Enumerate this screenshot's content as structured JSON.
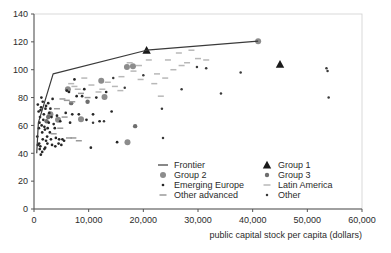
{
  "chart_data": {
    "type": "scatter",
    "title": "",
    "xlabel": "public capital stock per capita (dollars)",
    "ylabel": "",
    "xlim": [
      0,
      60000
    ],
    "ylim": [
      0,
      140
    ],
    "xticks": [
      0,
      10000,
      20000,
      30000,
      40000,
      50000,
      60000
    ],
    "xticklabels": [
      "0",
      "10,000",
      "20,000",
      "30,000",
      "40,000",
      "50,000",
      "60,000"
    ],
    "yticks": [
      0,
      20,
      40,
      60,
      80,
      100,
      120,
      140
    ],
    "yticklabels": [
      "0",
      "20",
      "40",
      "60",
      "80",
      "100",
      "120",
      "140"
    ],
    "grid": false,
    "legend_position": "inside-lower-right",
    "legend": [
      {
        "label": "Frontier",
        "marker": "line",
        "color": "#3a3a3a"
      },
      {
        "label": "Group 1",
        "marker": "triangle",
        "color": "#1a1a1a"
      },
      {
        "label": "Group 2",
        "marker": "circle-large",
        "color": "#8c8c8c"
      },
      {
        "label": "Group 3",
        "marker": "circle-small",
        "color": "#6e6e6e"
      },
      {
        "label": "Emerging Europe",
        "marker": "dot",
        "color": "#262626"
      },
      {
        "label": "Latin America",
        "marker": "dash",
        "color": "#b8b8b8"
      },
      {
        "label": "Other advanced",
        "marker": "dash",
        "color": "#9a9a9a"
      },
      {
        "label": "Other",
        "marker": "dot-small",
        "color": "#3a3a3a"
      }
    ],
    "series": [
      {
        "name": "Frontier",
        "type": "line",
        "color": "#3a3a3a",
        "points": [
          [
            500,
            40
          ],
          [
            800,
            62
          ],
          [
            3500,
            97
          ],
          [
            20600,
            114
          ],
          [
            41000,
            120.5
          ]
        ]
      },
      {
        "name": "Group 1",
        "type": "triangle",
        "color": "#1a1a1a",
        "points": [
          [
            45000,
            104
          ],
          [
            20600,
            114
          ]
        ]
      },
      {
        "name": "Group 2",
        "type": "circle-large",
        "color": "#8c8c8c",
        "points": [
          [
            41000,
            120.5
          ],
          [
            17000,
            102
          ],
          [
            18100,
            102.5
          ],
          [
            12300,
            92
          ],
          [
            12900,
            80.5
          ],
          [
            6200,
            86
          ],
          [
            4400,
            64
          ],
          [
            17100,
            48
          ],
          [
            8600,
            64.5
          ],
          [
            3000,
            68
          ]
        ]
      },
      {
        "name": "Group 3",
        "type": "circle-small",
        "color": "#6e6e6e",
        "points": [
          [
            18500,
            59.5
          ],
          [
            9800,
            77
          ],
          [
            6800,
            76
          ],
          [
            2600,
            66
          ],
          [
            2300,
            63
          ]
        ]
      },
      {
        "name": "Emerging Europe",
        "type": "dot",
        "color": "#262626",
        "points": [
          [
            700,
            46
          ],
          [
            600,
            52
          ],
          [
            900,
            58
          ],
          [
            1000,
            62
          ],
          [
            1100,
            66
          ],
          [
            1200,
            71
          ],
          [
            1300,
            73
          ],
          [
            1400,
            60
          ],
          [
            1500,
            55
          ],
          [
            1600,
            50
          ],
          [
            1700,
            64
          ],
          [
            1800,
            68
          ],
          [
            1900,
            59
          ],
          [
            2000,
            57
          ],
          [
            2100,
            72
          ],
          [
            2200,
            49
          ],
          [
            2400,
            52
          ],
          [
            2500,
            58
          ],
          [
            2700,
            62
          ],
          [
            2800,
            69
          ],
          [
            2900,
            55
          ],
          [
            3100,
            50
          ],
          [
            3200,
            66
          ],
          [
            3400,
            79
          ],
          [
            3600,
            61
          ],
          [
            3800,
            58
          ],
          [
            4000,
            51
          ],
          [
            4200,
            67
          ],
          [
            4600,
            50
          ],
          [
            4800,
            63
          ],
          [
            5200,
            50
          ],
          [
            5500,
            49
          ],
          [
            5800,
            69
          ],
          [
            6000,
            85
          ],
          [
            6400,
            84
          ],
          [
            6600,
            62
          ],
          [
            7000,
            68
          ],
          [
            7400,
            93
          ],
          [
            7800,
            81
          ],
          [
            8200,
            68
          ],
          [
            8800,
            81
          ],
          [
            9200,
            86
          ],
          [
            9600,
            64
          ],
          [
            10400,
            44
          ],
          [
            10800,
            68
          ],
          [
            11400,
            80
          ],
          [
            12000,
            63
          ],
          [
            13200,
            84
          ],
          [
            14200,
            70
          ],
          [
            15200,
            48
          ],
          [
            1050,
            43
          ],
          [
            1250,
            39
          ],
          [
            1500,
            41
          ],
          [
            700,
            75
          ],
          [
            850,
            70
          ],
          [
            950,
            47
          ],
          [
            1150,
            45
          ],
          [
            2050,
            44
          ],
          [
            2450,
            47
          ],
          [
            3300,
            46
          ],
          [
            3900,
            45
          ],
          [
            4500,
            47
          ],
          [
            5000,
            46
          ],
          [
            1350,
            80
          ],
          [
            1600,
            77
          ],
          [
            2200,
            74
          ],
          [
            2600,
            76
          ],
          [
            3000,
            72
          ],
          [
            1900,
            43
          ]
        ]
      },
      {
        "name": "Latin America",
        "type": "dash",
        "color": "#b8b8b8",
        "points": [
          [
            15800,
            85
          ],
          [
            17500,
            105
          ],
          [
            19200,
            103
          ],
          [
            21000,
            107
          ],
          [
            22500,
            97
          ],
          [
            23200,
            81
          ],
          [
            24500,
            107
          ],
          [
            26500,
            112
          ],
          [
            28000,
            105
          ],
          [
            28800,
            114
          ],
          [
            30000,
            108
          ],
          [
            31500,
            107
          ],
          [
            13500,
            91
          ],
          [
            14800,
            88
          ],
          [
            16000,
            95
          ],
          [
            11800,
            84
          ],
          [
            10500,
            89
          ],
          [
            9200,
            94
          ],
          [
            22000,
            90
          ],
          [
            19500,
            93
          ],
          [
            7400,
            88
          ],
          [
            8000,
            86
          ],
          [
            6800,
            90
          ],
          [
            18200,
            99
          ],
          [
            25500,
            100
          ],
          [
            27000,
            103
          ],
          [
            12500,
            86
          ],
          [
            24000,
            94
          ]
        ]
      },
      {
        "name": "Other advanced",
        "type": "dash",
        "color": "#9a9a9a",
        "points": [
          [
            5200,
            79
          ],
          [
            6000,
            78
          ],
          [
            7000,
            77
          ],
          [
            4200,
            72
          ],
          [
            8600,
            83
          ],
          [
            9800,
            80
          ],
          [
            5600,
            66
          ],
          [
            4800,
            58
          ],
          [
            3600,
            54
          ],
          [
            6400,
            51
          ],
          [
            7200,
            51
          ],
          [
            8200,
            49
          ]
        ]
      },
      {
        "name": "Other",
        "type": "dot-small",
        "color": "#3a3a3a",
        "points": [
          [
            23400,
            72
          ],
          [
            23600,
            51
          ],
          [
            27000,
            86
          ],
          [
            29800,
            102
          ],
          [
            31500,
            101
          ],
          [
            34200,
            83
          ],
          [
            37800,
            98
          ],
          [
            53500,
            101
          ],
          [
            53700,
            99
          ],
          [
            53900,
            80
          ],
          [
            20000,
            96
          ],
          [
            16600,
            87
          ],
          [
            14500,
            94
          ],
          [
            12800,
            63
          ],
          [
            10800,
            62
          ]
        ]
      }
    ]
  }
}
